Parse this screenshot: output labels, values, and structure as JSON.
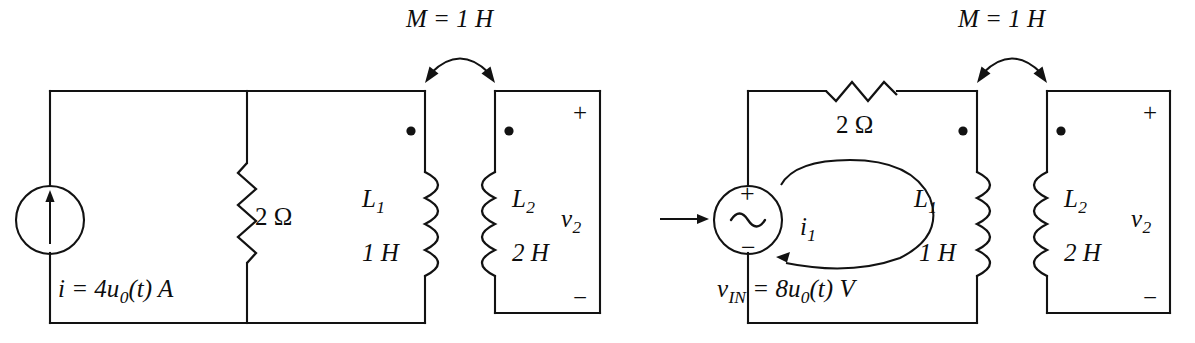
{
  "figure": {
    "kind": "circuit-schematic-transformation"
  },
  "left_circuit": {
    "name": "norton-form-circuit",
    "source": {
      "type": "independent-current-source",
      "symbol": "arrow-up",
      "label_prefix": "i",
      "label_equals": "=",
      "label_value": "4u",
      "label_sub": "0",
      "label_arg": "(t)",
      "label_unit": "A",
      "label_full": "i = 4u0(t) A"
    },
    "resistor": {
      "orientation": "vertical",
      "value": "2",
      "unit": "Ω",
      "label_full": "2 Ω"
    },
    "inductor_primary": {
      "name": "L",
      "sub": "1",
      "value": "1 H",
      "dot": "top"
    },
    "inductor_secondary": {
      "name": "L",
      "sub": "2",
      "value": "2 H",
      "dot": "top"
    },
    "coupling": {
      "label_name": "M",
      "label_equals": "=",
      "label_value": "1 H",
      "label_full": "M = 1 H",
      "arrow": "double-headed-curved"
    },
    "output": {
      "name": "v",
      "sub": "2",
      "plus": "+",
      "minus": "−"
    }
  },
  "transform_arrow": {
    "name": "implies-arrow",
    "glyph": "→"
  },
  "right_circuit": {
    "name": "thevenin-form-circuit",
    "source": {
      "type": "independent-voltage-source",
      "symbol": "sine-wave",
      "plus": "+",
      "minus": "−",
      "label_prefix": "v",
      "label_sub": "IN",
      "label_equals": "=",
      "label_value": "8u",
      "label_value_sub": "0",
      "label_arg": "(t)",
      "label_unit": "V",
      "label_full": "vIN = 8u0(t) V"
    },
    "resistor": {
      "orientation": "horizontal",
      "value": "2",
      "unit": "Ω",
      "label_full": "2 Ω"
    },
    "mesh_current": {
      "name": "i",
      "sub": "1",
      "direction": "counterclockwise"
    },
    "inductor_primary": {
      "name": "L",
      "sub": "1",
      "value": "1 H",
      "dot": "top"
    },
    "inductor_secondary": {
      "name": "L",
      "sub": "2",
      "value": "2 H",
      "dot": "top"
    },
    "coupling": {
      "label_name": "M",
      "label_equals": "=",
      "label_value": "1 H",
      "label_full": "M = 1 H",
      "arrow": "double-headed-curved"
    },
    "output": {
      "name": "v",
      "sub": "2",
      "plus": "+",
      "minus": "−"
    }
  },
  "colors": {
    "ink": "#121212",
    "background": "#ffffff"
  }
}
